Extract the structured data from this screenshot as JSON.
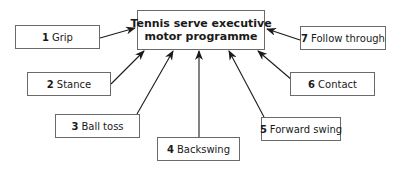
{
  "diagram": {
    "center": {
      "line1": "Tennis serve executive",
      "line2": "motor programme"
    },
    "steps": [
      {
        "num": "1",
        "label": "Grip"
      },
      {
        "num": "2",
        "label": "Stance"
      },
      {
        "num": "3",
        "label": "Ball toss"
      },
      {
        "num": "4",
        "label": "Backswing"
      },
      {
        "num": "5",
        "label": "Forward swing"
      },
      {
        "num": "6",
        "label": "Contact"
      },
      {
        "num": "7",
        "label": "Follow through"
      }
    ],
    "colors": {
      "border": "#6a6a6a",
      "arrow": "#1a1a1a"
    }
  }
}
